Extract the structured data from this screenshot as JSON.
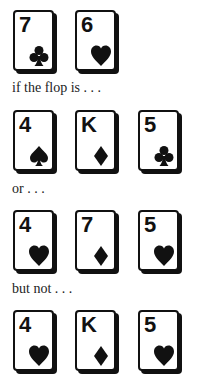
{
  "sections": [
    {
      "label": "hole-cards",
      "cards": [
        {
          "rank": "7",
          "suit": "club"
        },
        {
          "rank": "6",
          "suit": "heart"
        }
      ]
    },
    {
      "caption": "if the flop is . . .",
      "cards": [
        {
          "rank": "4",
          "suit": "spade"
        },
        {
          "rank": "K",
          "suit": "diamond"
        },
        {
          "rank": "5",
          "suit": "club"
        }
      ]
    },
    {
      "caption": "or . . .",
      "cards": [
        {
          "rank": "4",
          "suit": "heart"
        },
        {
          "rank": "7",
          "suit": "diamond"
        },
        {
          "rank": "5",
          "suit": "heart"
        }
      ]
    },
    {
      "caption": "but not . . .",
      "cards": [
        {
          "rank": "4",
          "suit": "heart"
        },
        {
          "rank": "K",
          "suit": "diamond"
        },
        {
          "rank": "5",
          "suit": "heart"
        }
      ]
    }
  ],
  "colors": {
    "ink": "#111111",
    "card_face": "#ffffff"
  }
}
